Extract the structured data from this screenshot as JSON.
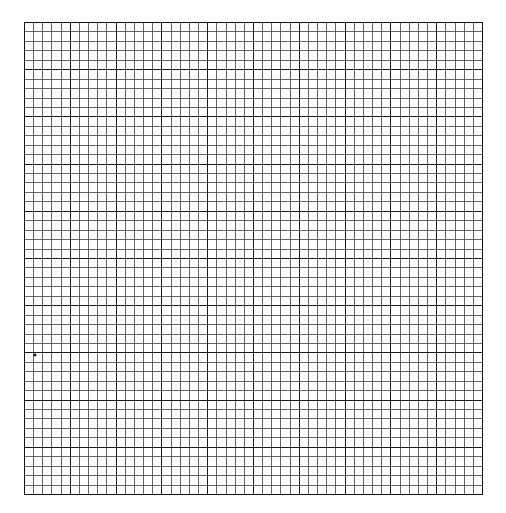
{
  "page": {
    "background": "#ffffff"
  },
  "grid": {
    "left": 24,
    "top": 22,
    "right": 482,
    "bottom": 494,
    "columns": 50,
    "rows": 50,
    "major_every": 5,
    "minor_color": "#555555",
    "major_color": "#1a1a1a",
    "border_color": "#111111",
    "minor_width": 0.9,
    "major_width": 1.3
  },
  "marks": [
    {
      "type": "dot",
      "x": 35,
      "y": 355,
      "size": 2.5,
      "color": "#111111"
    }
  ]
}
